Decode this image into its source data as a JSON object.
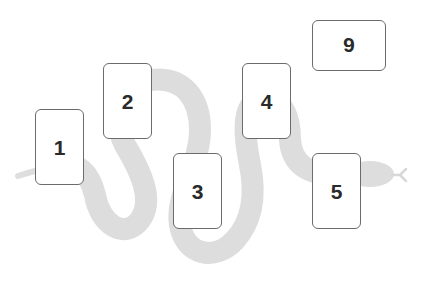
{
  "diagram": {
    "type": "card-spread-layout",
    "background": "#ffffff",
    "snake": {
      "color": "#dcdcdc",
      "description": "grey serpent winding left to right behind cards, tail at left, head with forked tongue at right"
    },
    "cards": [
      {
        "id": 1,
        "label": "1",
        "orientation": "portrait",
        "rotated_label": false,
        "x": 35,
        "y": 109
      },
      {
        "id": 2,
        "label": "2",
        "orientation": "portrait",
        "rotated_label": false,
        "x": 103,
        "y": 63
      },
      {
        "id": 3,
        "label": "3",
        "orientation": "portrait",
        "rotated_label": false,
        "x": 173,
        "y": 153
      },
      {
        "id": 4,
        "label": "4",
        "orientation": "portrait",
        "rotated_label": false,
        "x": 242,
        "y": 63
      },
      {
        "id": 5,
        "label": "5",
        "orientation": "portrait",
        "rotated_label": false,
        "x": 312,
        "y": 153
      },
      {
        "id": 6,
        "label": "6",
        "orientation": "landscape",
        "rotated_label": true,
        "x": 312,
        "y": 20
      }
    ],
    "card_border_color": "#6b6b6b",
    "label_color": "#2a2a2a"
  }
}
